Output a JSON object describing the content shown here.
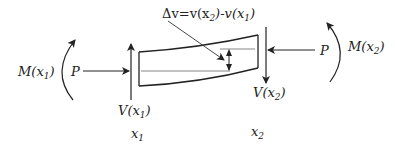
{
  "diagram": {
    "labels": {
      "delta_v": {
        "main": "Δv=v(x",
        "sub1": "2",
        "mid": ")-v(x",
        "sub2": "1",
        "end": ")"
      },
      "moment_left": {
        "main": "M(x",
        "sub": "1",
        "end": ")"
      },
      "moment_right": {
        "main": "M(x",
        "sub": "2",
        "end": ")"
      },
      "axial_left": "P",
      "axial_right": "P",
      "shear_left": {
        "main": "V(x",
        "sub": "1",
        "end": ")"
      },
      "shear_right": {
        "main": "V(x",
        "sub": "2",
        "end": ")"
      },
      "position_left": {
        "main": "x",
        "sub": "1"
      },
      "position_right": {
        "main": "x",
        "sub": "2"
      }
    },
    "colors": {
      "stroke": "#222222",
      "thin": "#555555"
    }
  }
}
